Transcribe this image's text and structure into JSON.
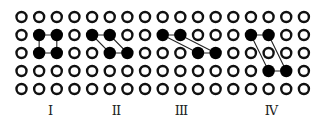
{
  "grid": {
    "columns": 17,
    "rows": 5,
    "origin_x": 21.5,
    "origin_y": 17,
    "spacing_x": 17.65,
    "spacing_y": 18,
    "radius": 5,
    "stroke_width": 2.4,
    "hollow_color": "#111111",
    "filled_color": "#000000",
    "line_color": "#222222"
  },
  "figures": [
    {
      "id": "I",
      "label": "I",
      "label_x": 50,
      "points": [
        [
          1,
          1
        ],
        [
          2,
          1
        ],
        [
          2,
          2
        ],
        [
          1,
          2
        ]
      ]
    },
    {
      "id": "II",
      "label": "II",
      "label_x": 116,
      "points": [
        [
          4,
          1
        ],
        [
          5,
          1
        ],
        [
          6,
          2
        ],
        [
          5,
          2
        ]
      ]
    },
    {
      "id": "III",
      "label": "III",
      "label_x": 181,
      "points": [
        [
          8,
          1
        ],
        [
          9,
          1
        ],
        [
          11,
          2
        ],
        [
          10,
          2
        ]
      ]
    },
    {
      "id": "IV",
      "label": "IV",
      "label_x": 271,
      "points": [
        [
          13,
          1
        ],
        [
          14,
          1
        ],
        [
          15,
          3
        ],
        [
          14,
          3
        ]
      ]
    }
  ]
}
